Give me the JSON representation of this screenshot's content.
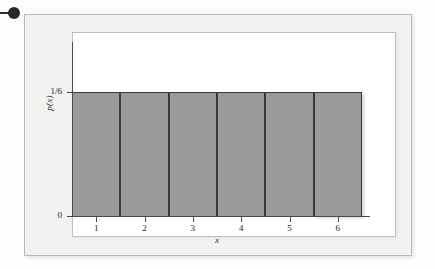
{
  "figure": {
    "bullet_marker": "•",
    "frame_color": "#f2f2f1",
    "panel_color": "#ffffff",
    "bar_color": "#9a9a9a",
    "axis_color": "#4a4a4a"
  },
  "chart_data": {
    "type": "bar",
    "title": "",
    "subtitle": "",
    "xlabel": "x",
    "ylabel": "p(x)",
    "categories": [
      "1",
      "2",
      "3",
      "4",
      "5",
      "6"
    ],
    "values": [
      0.1666667,
      0.1666667,
      0.1666667,
      0.1666667,
      0.1666667,
      0.1666667
    ],
    "value_label": "1/6",
    "xtick_labels": [
      "1",
      "2",
      "3",
      "4",
      "5",
      "6"
    ],
    "ytick_labels": [
      "0",
      "1/6"
    ],
    "ytick_values": [
      0,
      0.1666667
    ],
    "ylim": [
      0,
      0.2333
    ],
    "xlim": [
      0.5,
      6.5
    ],
    "grid": false,
    "legend": null,
    "legend_position": "none",
    "bar_width": 1.0,
    "annotations": []
  }
}
